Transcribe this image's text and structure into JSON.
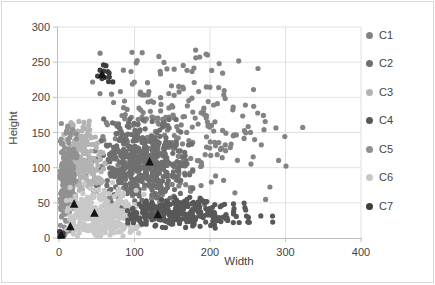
{
  "chart_data": {
    "type": "scatter",
    "title": "",
    "xlabel": "Width",
    "ylabel": "Height",
    "xlim": [
      0,
      400
    ],
    "ylim": [
      0,
      300
    ],
    "x_ticks": [
      0,
      100,
      200,
      300,
      400
    ],
    "y_ticks": [
      0,
      50,
      100,
      150,
      200,
      250,
      300
    ],
    "grid": true,
    "legend_position": "right",
    "point_marker": "circle",
    "point_radius": 2.6,
    "seed": 42,
    "clusters": [
      {
        "name": "C1",
        "color": "#838383",
        "blobs": [
          {
            "count": 300,
            "cx": 150,
            "cy": 152,
            "sx": 62,
            "sy": 56,
            "xr": [
              15,
              325
            ],
            "yr": [
              30,
              268
            ]
          }
        ]
      },
      {
        "name": "C2",
        "color": "#6f6f6f",
        "blobs": [
          {
            "count": 450,
            "cx": 110,
            "cy": 104,
            "sx": 30,
            "sy": 32,
            "xr": [
              42,
              180
            ],
            "yr": [
              40,
              170
            ]
          }
        ]
      },
      {
        "name": "C3",
        "color": "#b3b3b3",
        "blobs": [
          {
            "count": 200,
            "cx": 30,
            "cy": 112,
            "sx": 14,
            "sy": 30,
            "xr": [
              5,
              62
            ],
            "yr": [
              60,
              168
            ]
          }
        ]
      },
      {
        "name": "C4",
        "color": "#585858",
        "blobs": [
          {
            "count": 260,
            "cx": 155,
            "cy": 36,
            "sx": 45,
            "sy": 10,
            "xr": [
              90,
              290
            ],
            "yr": [
              14,
              58
            ]
          }
        ]
      },
      {
        "name": "C5",
        "color": "#919191",
        "blobs": [
          {
            "count": 200,
            "cx": 9,
            "cy": 75,
            "sx": 7,
            "sy": 48,
            "xr": [
              1,
              24
            ],
            "yr": [
              3,
              168
            ]
          }
        ]
      },
      {
        "name": "C6",
        "color": "#c8c8c8",
        "blobs": [
          {
            "count": 330,
            "cx": 55,
            "cy": 32,
            "sx": 26,
            "sy": 19,
            "xr": [
              8,
              115
            ],
            "yr": [
              2,
              80
            ]
          }
        ]
      },
      {
        "name": "C7",
        "color": "#3d3d3d",
        "blobs": [
          {
            "count": 14,
            "cx": 59,
            "cy": 231,
            "sx": 5,
            "sy": 7,
            "xr": [
              48,
              72
            ],
            "yr": [
              216,
              248
            ]
          },
          {
            "count": 9,
            "cx": 3,
            "cy": 5,
            "sx": 2.5,
            "sy": 3,
            "xr": [
              0,
              10
            ],
            "yr": [
              0,
              14
            ]
          }
        ]
      }
    ],
    "draw_order": [
      "C1",
      "C2",
      "C3",
      "C5",
      "C6",
      "C4",
      "C7"
    ],
    "centroids": {
      "marker": "triangle",
      "color": "#141414",
      "points": [
        [
          3,
          4
        ],
        [
          15,
          16
        ],
        [
          20,
          48
        ],
        [
          47,
          35
        ],
        [
          120,
          108
        ],
        [
          131,
          33
        ],
        [
          57,
          232
        ]
      ]
    },
    "colors": {
      "axis_line": "#bfbfbf",
      "gridline": "#e0e0e0",
      "tick_text": "#444444",
      "chart_border": "#d9d9d9",
      "background": "#ffffff"
    }
  }
}
